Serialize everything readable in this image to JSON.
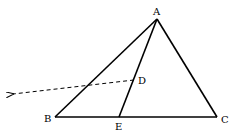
{
  "diagram": {
    "type": "geometry-triangle",
    "points": {
      "A": {
        "label": "A",
        "x": 157,
        "y": 19
      },
      "B": {
        "label": "B",
        "x": 55,
        "y": 117
      },
      "C": {
        "label": "C",
        "x": 217,
        "y": 117
      },
      "D": {
        "label": "D",
        "x": 134,
        "y": 80
      },
      "E": {
        "label": "E",
        "x": 119,
        "y": 117
      }
    },
    "segments": [
      {
        "from": "A",
        "to": "B",
        "style": "solid"
      },
      {
        "from": "A",
        "to": "C",
        "style": "solid"
      },
      {
        "from": "B",
        "to": "C",
        "style": "solid"
      },
      {
        "from": "A",
        "to": "E",
        "style": "solid"
      }
    ],
    "rays": [
      {
        "from": "D",
        "direction": "left",
        "style": "dashed-arrow",
        "tip": {
          "x": 12,
          "y": 94
        }
      }
    ],
    "colors": {
      "line": "#000000",
      "background": "#ffffff"
    }
  }
}
